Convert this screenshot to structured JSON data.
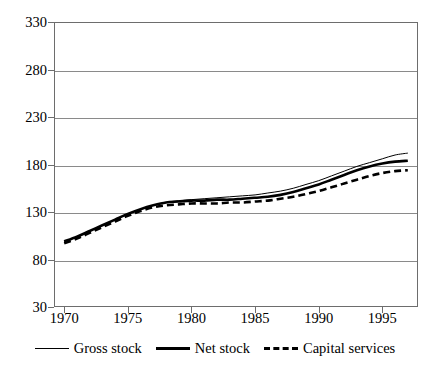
{
  "chart_data": {
    "type": "line",
    "title": "",
    "xlabel": "",
    "ylabel": "",
    "xlim": [
      1969.2,
      1997.8
    ],
    "ylim": [
      30,
      330
    ],
    "grid": true,
    "legend_position": "bottom",
    "yticks": [
      30,
      80,
      130,
      180,
      230,
      280,
      330
    ],
    "xticks": [
      1970,
      1975,
      1980,
      1985,
      1990,
      1995
    ],
    "ytick_labels": [
      "30",
      "80",
      "130",
      "180",
      "230",
      "280",
      "330"
    ],
    "xtick_labels": [
      "1970",
      "1975",
      "1980",
      "1985",
      "1990",
      "1995"
    ],
    "x": [
      1970,
      1971,
      1972,
      1973,
      1974,
      1975,
      1976,
      1977,
      1978,
      1979,
      1980,
      1981,
      1982,
      1983,
      1984,
      1985,
      1986,
      1987,
      1988,
      1989,
      1990,
      1991,
      1992,
      1993,
      1994,
      1995,
      1996,
      1997
    ],
    "series": [
      {
        "name": "Gross stock",
        "style": "solid-thin",
        "color": "#000000",
        "values": [
          99,
          104,
          110,
          116,
          122,
          128,
          133,
          137,
          140,
          142,
          143,
          144,
          145,
          146,
          147,
          148,
          150,
          152,
          155,
          159,
          163,
          168,
          173,
          178,
          182,
          186,
          190,
          192
        ]
      },
      {
        "name": "Net stock",
        "style": "solid-thick",
        "color": "#000000",
        "values": [
          99,
          104,
          110,
          116,
          122,
          128,
          133,
          137,
          140,
          141,
          142,
          142,
          143,
          143,
          144,
          145,
          146,
          148,
          151,
          155,
          159,
          164,
          169,
          174,
          178,
          181,
          183,
          184
        ]
      },
      {
        "name": "Capital services",
        "style": "dashed-thick",
        "color": "#000000",
        "values": [
          97,
          102,
          108,
          114,
          120,
          126,
          131,
          135,
          137,
          138,
          139,
          139,
          139,
          140,
          140,
          141,
          142,
          144,
          146,
          149,
          152,
          156,
          160,
          164,
          168,
          171,
          173,
          174
        ]
      }
    ]
  },
  "legend": {
    "items": [
      {
        "label": "Gross stock"
      },
      {
        "label": "Net stock"
      },
      {
        "label": "Capital services"
      }
    ]
  }
}
